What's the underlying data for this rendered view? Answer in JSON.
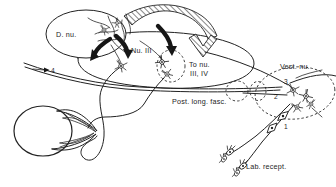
{
  "figure": {
    "background": "#ffffff",
    "ink_color": "#222222",
    "labels": {
      "d_nu": "D. nu.",
      "nu_iii": "Nu. III",
      "to_nu_line1": "To nu.",
      "to_nu_line2": "III, IV",
      "post_long_fasc": "Post. long. fasc.",
      "vest_nu": "Vest. nu.",
      "lab_recept": "Lab. recept.",
      "n1": "1",
      "n2": "2",
      "n3": "3",
      "n4": "4"
    }
  }
}
